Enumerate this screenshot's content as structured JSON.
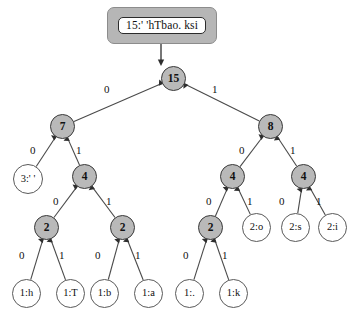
{
  "figure": {
    "type": "huffman-tree-diagram",
    "encoded_string_box": {
      "text": "15:' 'hTbao. ksi"
    },
    "colors": {
      "internal_node_fill": "#b9b9b9",
      "internal_node_stroke": "#3a3a3a",
      "leaf_node_fill": "#ffffff",
      "leaf_node_stroke": "#5a5a5a",
      "edge_stroke": "#4a4a4a",
      "box_outer_fill": "#b6b6b6",
      "box_inner_fill": "#ffffff",
      "text": "#111111"
    },
    "nodes": [
      {
        "id": "root",
        "label": "15",
        "kind": "internal",
        "x": 161,
        "y": 66,
        "d": 25
      },
      {
        "id": "n7",
        "label": "7",
        "kind": "internal",
        "x": 50,
        "y": 114,
        "d": 25
      },
      {
        "id": "n8",
        "label": "8",
        "kind": "internal",
        "x": 258,
        "y": 114,
        "d": 25
      },
      {
        "id": "l3space",
        "label": "3:' '",
        "kind": "leaf",
        "x": 13,
        "y": 164,
        "d": 30
      },
      {
        "id": "n4a",
        "label": "4",
        "kind": "internal",
        "x": 72,
        "y": 164,
        "d": 25
      },
      {
        "id": "n4b",
        "label": "4",
        "kind": "internal",
        "x": 220,
        "y": 164,
        "d": 25
      },
      {
        "id": "n4c",
        "label": "4",
        "kind": "internal",
        "x": 291,
        "y": 164,
        "d": 25
      },
      {
        "id": "n2a",
        "label": "2",
        "kind": "internal",
        "x": 34,
        "y": 215,
        "d": 25
      },
      {
        "id": "n2b",
        "label": "2",
        "kind": "internal",
        "x": 110,
        "y": 215,
        "d": 25
      },
      {
        "id": "n2c",
        "label": "2",
        "kind": "internal",
        "x": 198,
        "y": 215,
        "d": 25
      },
      {
        "id": "l2o",
        "label": "2:o",
        "kind": "leaf",
        "x": 242,
        "y": 213,
        "d": 29
      },
      {
        "id": "l2s",
        "label": "2:s",
        "kind": "leaf",
        "x": 281,
        "y": 213,
        "d": 29
      },
      {
        "id": "l2i",
        "label": "2:i",
        "kind": "leaf",
        "x": 318,
        "y": 213,
        "d": 29
      },
      {
        "id": "l1h",
        "label": "1:h",
        "kind": "leaf",
        "x": 12,
        "y": 279,
        "d": 29
      },
      {
        "id": "l1T",
        "label": "1:T",
        "kind": "leaf",
        "x": 56,
        "y": 279,
        "d": 29
      },
      {
        "id": "l1b",
        "label": "1:b",
        "kind": "leaf",
        "x": 90,
        "y": 279,
        "d": 29
      },
      {
        "id": "l1a",
        "label": "1:a",
        "kind": "leaf",
        "x": 134,
        "y": 279,
        "d": 29
      },
      {
        "id": "l1dot",
        "label": "1:.",
        "kind": "leaf",
        "x": 175,
        "y": 279,
        "d": 29
      },
      {
        "id": "l1k",
        "label": "1:k",
        "kind": "leaf",
        "x": 219,
        "y": 279,
        "d": 29
      }
    ],
    "edges": [
      {
        "from": "root",
        "to": "n7",
        "bit": "0",
        "label_x": 104,
        "label_y": 84
      },
      {
        "from": "root",
        "to": "n8",
        "bit": "1",
        "label_x": 212,
        "label_y": 84
      },
      {
        "from": "n7",
        "to": "l3space",
        "bit": "0",
        "label_x": 30,
        "label_y": 145
      },
      {
        "from": "n7",
        "to": "n4a",
        "bit": "1",
        "label_x": 76,
        "label_y": 145
      },
      {
        "from": "n8",
        "to": "n4b",
        "bit": "0",
        "label_x": 239,
        "label_y": 145
      },
      {
        "from": "n8",
        "to": "n4c",
        "bit": "1",
        "label_x": 290,
        "label_y": 145
      },
      {
        "from": "n4a",
        "to": "n2a",
        "bit": "0",
        "label_x": 53,
        "label_y": 196
      },
      {
        "from": "n4a",
        "to": "n2b",
        "bit": "1",
        "label_x": 106,
        "label_y": 196
      },
      {
        "from": "n4b",
        "to": "n2c",
        "bit": "0",
        "label_x": 206,
        "label_y": 196
      },
      {
        "from": "n4b",
        "to": "l2o",
        "bit": "1",
        "label_x": 247,
        "label_y": 196
      },
      {
        "from": "n4c",
        "to": "l2s",
        "bit": "0",
        "label_x": 279,
        "label_y": 196
      },
      {
        "from": "n4c",
        "to": "l2i",
        "bit": "1",
        "label_x": 316,
        "label_y": 196
      },
      {
        "from": "n2a",
        "to": "l1h",
        "bit": "0",
        "label_x": 19,
        "label_y": 250
      },
      {
        "from": "n2a",
        "to": "l1T",
        "bit": "1",
        "label_x": 59,
        "label_y": 250
      },
      {
        "from": "n2b",
        "to": "l1b",
        "bit": "0",
        "label_x": 95,
        "label_y": 250
      },
      {
        "from": "n2b",
        "to": "l1a",
        "bit": "1",
        "label_x": 135,
        "label_y": 250
      },
      {
        "from": "n2c",
        "to": "l1dot",
        "bit": "0",
        "label_x": 183,
        "label_y": 250
      },
      {
        "from": "n2c",
        "to": "l1k",
        "bit": "1",
        "label_x": 222,
        "label_y": 250
      }
    ],
    "string_box_geometry": {
      "x": 107,
      "y": 7,
      "w": 110,
      "h": 37
    },
    "root_arrow": {
      "from_x": 161,
      "from_y": 44,
      "to_x": 161,
      "to_y": 62
    }
  }
}
